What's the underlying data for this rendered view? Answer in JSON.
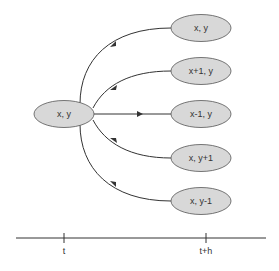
{
  "diagram": {
    "colors": {
      "node_fill": "#d8d8d8",
      "node_stroke": "#555555",
      "edge": "#333333",
      "text": "#333333"
    },
    "source": {
      "label": "x, y"
    },
    "targets": [
      {
        "label": "x, y"
      },
      {
        "label": "x+1, y"
      },
      {
        "label": "x-1, y"
      },
      {
        "label": "x, y+1"
      },
      {
        "label": "x, y-1"
      }
    ],
    "timeline": {
      "ticks": [
        {
          "label": "t"
        },
        {
          "label": "t+h"
        }
      ]
    }
  }
}
